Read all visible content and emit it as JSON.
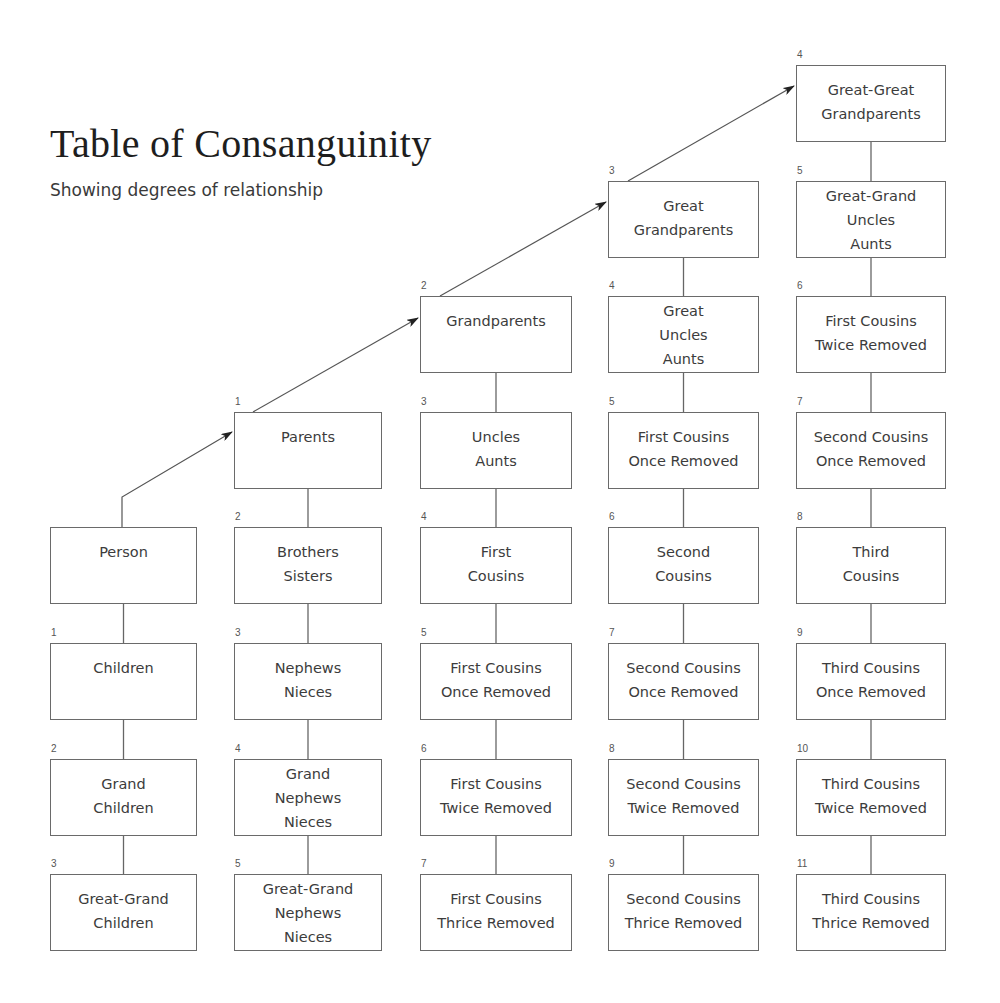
{
  "header": {
    "title": "Table of Consanguinity",
    "subtitle": "Showing degrees of relationship"
  },
  "columns": [
    {
      "name": "descendants",
      "boxes": [
        {
          "degree": "",
          "lines": [
            "Person"
          ]
        },
        {
          "degree": "1",
          "lines": [
            "Children"
          ]
        },
        {
          "degree": "2",
          "lines": [
            "Grand",
            "Children"
          ]
        },
        {
          "degree": "3",
          "lines": [
            "Great-Grand",
            "Children"
          ]
        }
      ]
    },
    {
      "name": "parents-line",
      "boxes": [
        {
          "degree": "1",
          "lines": [
            "Parents"
          ]
        },
        {
          "degree": "2",
          "lines": [
            "Brothers",
            "Sisters"
          ]
        },
        {
          "degree": "3",
          "lines": [
            "Nephews",
            "Nieces"
          ]
        },
        {
          "degree": "4",
          "lines": [
            "Grand",
            "Nephews",
            "Nieces"
          ]
        },
        {
          "degree": "5",
          "lines": [
            "Great-Grand",
            "Nephews",
            "Nieces"
          ]
        }
      ]
    },
    {
      "name": "grandparents-line",
      "boxes": [
        {
          "degree": "2",
          "lines": [
            "Grandparents"
          ]
        },
        {
          "degree": "3",
          "lines": [
            "Uncles",
            "Aunts"
          ]
        },
        {
          "degree": "4",
          "lines": [
            "First",
            "Cousins"
          ]
        },
        {
          "degree": "5",
          "lines": [
            "First Cousins",
            "Once Removed"
          ]
        },
        {
          "degree": "6",
          "lines": [
            "First Cousins",
            "Twice Removed"
          ]
        },
        {
          "degree": "7",
          "lines": [
            "First Cousins",
            "Thrice Removed"
          ]
        }
      ]
    },
    {
      "name": "great-grandparents-line",
      "boxes": [
        {
          "degree": "3",
          "lines": [
            "Great",
            "Grandparents"
          ]
        },
        {
          "degree": "4",
          "lines": [
            "Great",
            "Uncles",
            "Aunts"
          ]
        },
        {
          "degree": "5",
          "lines": [
            "First Cousins",
            "Once Removed"
          ]
        },
        {
          "degree": "6",
          "lines": [
            "Second",
            "Cousins"
          ]
        },
        {
          "degree": "7",
          "lines": [
            "Second Cousins",
            "Once Removed"
          ]
        },
        {
          "degree": "8",
          "lines": [
            "Second Cousins",
            "Twice Removed"
          ]
        },
        {
          "degree": "9",
          "lines": [
            "Second Cousins",
            "Thrice Removed"
          ]
        }
      ]
    },
    {
      "name": "great-great-grandparents-line",
      "boxes": [
        {
          "degree": "4",
          "lines": [
            "Great-Great",
            "Grandparents"
          ]
        },
        {
          "degree": "5",
          "lines": [
            "Great-Grand",
            "Uncles",
            "Aunts"
          ]
        },
        {
          "degree": "6",
          "lines": [
            "First Cousins",
            "Twice Removed"
          ]
        },
        {
          "degree": "7",
          "lines": [
            "Second Cousins",
            "Once Removed"
          ]
        },
        {
          "degree": "8",
          "lines": [
            "Third",
            "Cousins"
          ]
        },
        {
          "degree": "9",
          "lines": [
            "Third Cousins",
            "Once Removed"
          ]
        },
        {
          "degree": "10",
          "lines": [
            "Third Cousins",
            "Twice Removed"
          ]
        },
        {
          "degree": "11",
          "lines": [
            "Third Cousins",
            "Thrice Removed"
          ]
        }
      ]
    }
  ]
}
